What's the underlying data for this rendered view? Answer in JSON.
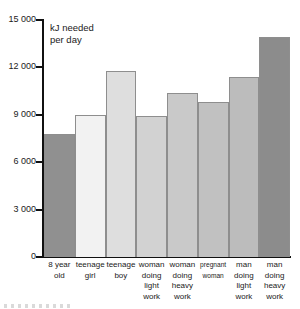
{
  "chart_data": {
    "type": "bar",
    "title": "",
    "axis_title": "kJ needed\nper day",
    "xlabel": "",
    "ylabel": "kJ needed per day",
    "ylim": [
      0,
      15000
    ],
    "ytick_step": 3000,
    "yticks": [
      {
        "value": 15000,
        "label": "15 000"
      },
      {
        "value": 12000,
        "label": "12 000"
      },
      {
        "value": 9000,
        "label": "9 000"
      },
      {
        "value": 6000,
        "label": "6 000"
      },
      {
        "value": 3000,
        "label": "3 000"
      },
      {
        "value": 0,
        "label": "0"
      }
    ],
    "grid": false,
    "legend": "none",
    "categories": [
      "8 year\nold",
      "teenage\ngirl",
      "teenage\nboy",
      "woman\ndoing\nlight\nwork",
      "woman\ndoing\nheavy\nwork",
      "pregnant\nwoman",
      "man\ndoing\nlight\nwork",
      "man\ndoing\nheavy\nwork"
    ],
    "values": [
      7800,
      9000,
      11800,
      8900,
      10400,
      9800,
      11400,
      13900
    ],
    "bar_colors": [
      "#909090",
      "#f2f2f2",
      "#dedede",
      "#d2d2d2",
      "#c9c9c9",
      "#c1c1c1",
      "#bcbcbc",
      "#8c8c8c"
    ],
    "bars": [
      {
        "category": "8 year old",
        "value": 7800,
        "color": "#909090"
      },
      {
        "category": "teenage girl",
        "value": 9000,
        "color": "#f2f2f2"
      },
      {
        "category": "teenage boy",
        "value": 11800,
        "color": "#dedede"
      },
      {
        "category": "woman doing light work",
        "value": 8900,
        "color": "#d2d2d2"
      },
      {
        "category": "woman doing heavy work",
        "value": 10400,
        "color": "#c9c9c9"
      },
      {
        "category": "pregnant woman",
        "value": 9800,
        "color": "#c1c1c1"
      },
      {
        "category": "man doing light work",
        "value": 11400,
        "color": "#bcbcbc"
      },
      {
        "category": "man doing heavy work",
        "value": 13900,
        "color": "#8c8c8c"
      }
    ]
  },
  "colors": {
    "axis": "#111111",
    "text": "#1a1a1a",
    "background": "#ffffff",
    "bar_outline": "#8e8e8e"
  }
}
